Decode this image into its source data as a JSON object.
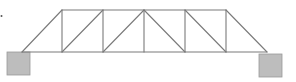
{
  "diagram": {
    "type": "pratt-truss-bridge",
    "colors": {
      "member": "#7a7a7a",
      "support_fill": "#bdbdbd",
      "support_stroke": "#9a9a9a",
      "background": "#ffffff"
    },
    "top_chord": {
      "y": 10,
      "nodes_x": [
        62,
        103,
        144,
        185,
        226
      ]
    },
    "bottom_chord": {
      "y": 52,
      "nodes_x": [
        22,
        62,
        103,
        144,
        185,
        226,
        267
      ]
    },
    "supports": [
      {
        "name": "left-support",
        "x": 7,
        "y": 52,
        "width": 23,
        "height": 23
      },
      {
        "name": "right-support",
        "x": 259,
        "y": 54,
        "width": 23,
        "height": 23
      }
    ],
    "marker_dot": {
      "x": 1.5,
      "y": 16
    }
  }
}
